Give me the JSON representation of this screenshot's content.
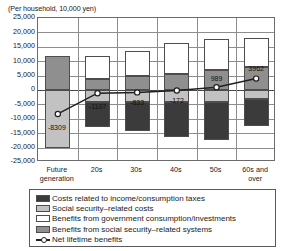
{
  "chart_data": {
    "type": "bar",
    "title": "",
    "subtitle": "",
    "unit_note": "(Per household, 10,000 yen)",
    "xlabel": "",
    "ylabel": "",
    "ylim": [
      -25000,
      25000
    ],
    "ytick_step": 5000,
    "grid": true,
    "stacked": true,
    "legend_position": "bottom",
    "ytick_labels": [
      "25,000",
      "20,000",
      "15,000",
      "10,000",
      "5,000",
      "0",
      "-5,000",
      "-10,000",
      "-15,000",
      "-20,000",
      "-25,000"
    ],
    "ytick_values": [
      25000,
      20000,
      15000,
      10000,
      5000,
      0,
      -5000,
      -10000,
      -15000,
      -20000,
      -25000
    ],
    "categories": [
      "Future generation",
      "20s",
      "30s",
      "40s",
      "50s",
      "60s and over"
    ],
    "series": [
      {
        "name": "Costs related to income/consumption taxes",
        "key": "tax",
        "color": "#3b3b3b",
        "values": [
          0,
          -8400,
          -10100,
          -12200,
          -13200,
          -9300
        ]
      },
      {
        "name": "Social security–related costs",
        "key": "sscost",
        "color": "#c2c2c2",
        "values": [
          -20200,
          -4300,
          -4200,
          -4200,
          -4000,
          -3200
        ]
      },
      {
        "name": "Benefits from government consumption/investments",
        "key": "govben",
        "color": "#ffffff",
        "values": [
          0,
          7900,
          8900,
          10500,
          11000,
          10200
        ]
      },
      {
        "name": "Benefits from social security–related systems",
        "key": "ssben",
        "color": "#8f8f8f",
        "values": [
          11800,
          3800,
          4800,
          5700,
          6800,
          8000
        ]
      }
    ],
    "line_series": {
      "name": "Net lifetime benefits",
      "color": "#1f1f1f",
      "marker": "open-circle",
      "values": [
        -8309,
        -1107,
        -833,
        -172,
        989,
        3962
      ],
      "labels": [
        "-8309",
        "-1107",
        "-833",
        "-172",
        "989",
        "3962"
      ]
    }
  },
  "legend": {
    "items": [
      {
        "key": "tax",
        "label": "Costs related to income/consumption taxes"
      },
      {
        "key": "sscost",
        "label": "Social security–related costs"
      },
      {
        "key": "govben",
        "label": "Benefits from government consumption/investments"
      },
      {
        "key": "ssben",
        "label": "Benefits from social security–related systems"
      },
      {
        "key": "line",
        "label": "Net lifetime benefits"
      }
    ]
  }
}
